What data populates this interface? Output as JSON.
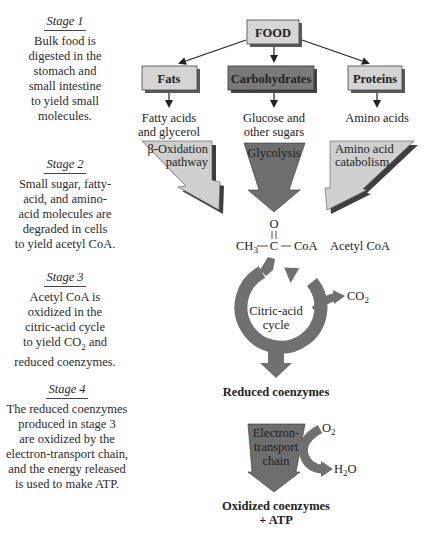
{
  "stages": [
    {
      "title": "Stage 1",
      "body": "Bulk food is\ndigested in the\nstomach and\nsmall intestine\nto yield small\nmolecules."
    },
    {
      "title": "Stage 2",
      "body": "Small sugar, fatty-\nacid, and amino-\nacid molecules are\ndegraded in cells\nto yield acetyl CoA."
    },
    {
      "title": "Stage 3",
      "body_pre": "Acetyl CoA is\noxidized in the\ncitric-acid cycle\nto yield CO",
      "body_sub": "2",
      "body_post": " and\nreduced coenzymes."
    },
    {
      "title": "Stage 4",
      "body": "The reduced coenzymes\nproduced in stage 3\nare oxidized by the\nelectron-transport chain,\nand the energy released\nis used to make ATP."
    }
  ],
  "boxes": {
    "food": "FOOD",
    "fats": "Fats",
    "carbohydrates": "Carbohydrates",
    "proteins": "Proteins"
  },
  "products": {
    "fats": [
      "Fatty acids",
      "and glycerol"
    ],
    "carbohydrates": [
      "Glucose and",
      "other sugars"
    ],
    "proteins": [
      "Amino acids"
    ]
  },
  "pathways": {
    "beta_oxidation": [
      "β-Oxidation",
      "pathway"
    ],
    "glycolysis": [
      "Glycolysis"
    ],
    "amino_acid": [
      "Amino acid",
      "catabolism"
    ]
  },
  "acetyl_coa": {
    "oxygen": "O",
    "ch3": "CH",
    "ch3_sub": "3",
    "carbon": "C",
    "coa": "CoA",
    "label": "Acetyl CoA"
  },
  "citric_cycle": {
    "label": [
      "Citric-acid",
      "cycle"
    ],
    "co2": "CO",
    "co2_sub": "2"
  },
  "reduced_coenzymes": "Reduced coenzymes",
  "etc": {
    "label": [
      "Electron-",
      "transport",
      "chain"
    ],
    "o2": "O",
    "o2_sub": "2",
    "h2o_h": "H",
    "h2o_sub": "2",
    "h2o_o": "O"
  },
  "final": {
    "line1": "Oxidized coenzymes",
    "line2": "+ ATP"
  },
  "colors": {
    "box_light": "#d4d4d4",
    "box_dark": "#7a7a7a",
    "arrow_light": "#cfcfcf",
    "arrow_dark": "#6e6e6e",
    "cycle": "#707070"
  }
}
